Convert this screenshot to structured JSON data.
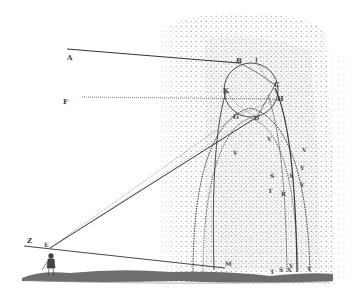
{
  "figure": {
    "title": "",
    "colors": {
      "background": "#ffffff",
      "ink": "#333333",
      "stipple": "#6a6a6a",
      "ground": "#4a4a4a"
    }
  },
  "labels": {
    "A": "A",
    "F": "F",
    "B": "B",
    "I": "I",
    "C": "C",
    "H": "H",
    "K": "K",
    "G": "G",
    "D": "D",
    "Z": "Z",
    "E": "E",
    "M": "M",
    "V1": "V",
    "V2": "V",
    "V3": "V",
    "S1": "S",
    "X1": "X",
    "Y1": "Y",
    "Y2": "Y",
    "T1": "T",
    "R1": "R",
    "T2": "T",
    "S2": "S",
    "X2": "X",
    "V4": "V",
    "Y3": "Y"
  }
}
